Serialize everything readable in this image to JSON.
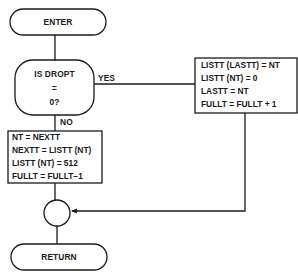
{
  "diagram": {
    "type": "flowchart",
    "nodes": {
      "enter": {
        "shape": "terminal",
        "label": "ENTER"
      },
      "decision": {
        "shape": "decision",
        "lines": [
          "IS DROPT",
          "=",
          "0?"
        ]
      },
      "yes_box": {
        "shape": "process",
        "lines": [
          "LISTT (LASTT) = NT",
          "LISTT (NT) = 0",
          "LASTT = NT",
          "FULLT = FULLT + 1"
        ]
      },
      "no_box": {
        "shape": "process",
        "lines": [
          "NT = NEXTT",
          "NEXTT = LISTT (NT)",
          "LISTT (NT) = 512",
          "FULLT = FULLT−1"
        ]
      },
      "merge": {
        "shape": "connector",
        "label": ""
      },
      "return": {
        "shape": "terminal",
        "label": "RETURN"
      }
    },
    "edges": {
      "yes_label": "YES",
      "no_label": "NO"
    },
    "colors": {
      "stroke": "#1a1a1a",
      "background": "#ffffff"
    }
  }
}
